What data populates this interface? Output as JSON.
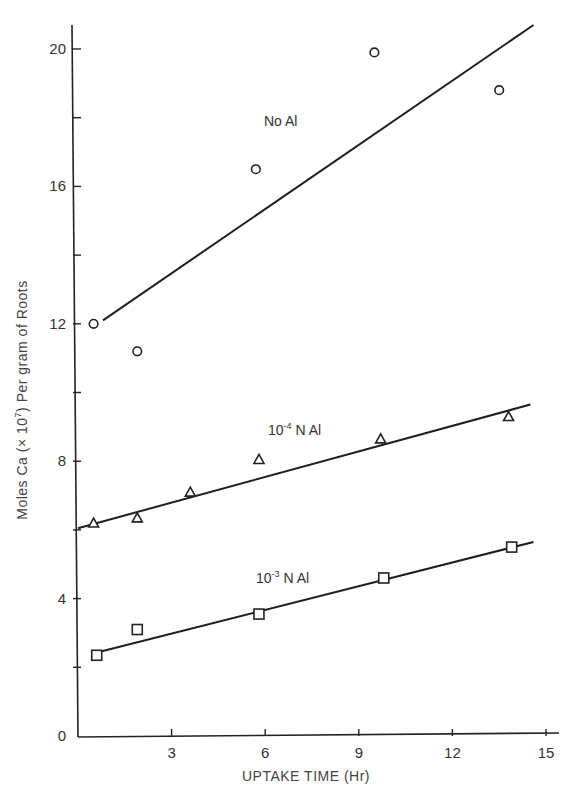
{
  "chart_data": {
    "type": "scatter",
    "title": "",
    "xlabel": "UPTAKE TIME (Hr)",
    "ylabel": "Moles Ca (× 10⁷) Per gram of Roots",
    "ylabel_parts": {
      "prefix": "Moles Ca (",
      "times": "×",
      "base": " 10",
      "exp": "7",
      "suffix": ") Per gram of Roots"
    },
    "xlim": [
      0,
      15
    ],
    "ylim": [
      0,
      20
    ],
    "x_ticks": [
      0,
      3,
      6,
      9,
      12,
      15
    ],
    "x_tick_labels": [
      "3",
      "6",
      "9",
      "12",
      "15"
    ],
    "y_ticks": [
      0,
      2,
      4,
      6,
      8,
      10,
      12,
      14,
      16,
      18,
      20
    ],
    "y_tick_labels": [
      "0",
      "4",
      "8",
      "12",
      "16",
      "20"
    ],
    "grid": false,
    "legend": "inline labels",
    "series": [
      {
        "name": "No Al",
        "label_text": "No Al",
        "marker": "circle",
        "x": [
          0.5,
          1.9,
          5.7,
          9.5,
          13.5
        ],
        "y": [
          12.0,
          11.2,
          16.5,
          19.9,
          18.8
        ],
        "fit_line": {
          "x": [
            0.8,
            14.6
          ],
          "y": [
            12.1,
            20.7
          ]
        }
      },
      {
        "name": "10^-4 N Al",
        "label_base": "10",
        "label_exp": "-4",
        "label_rest": " N Al",
        "marker": "triangle",
        "x": [
          0.5,
          1.9,
          3.6,
          5.8,
          9.7,
          13.8
        ],
        "y": [
          6.2,
          6.35,
          7.1,
          8.05,
          8.65,
          9.3
        ],
        "fit_line": {
          "x": [
            0.0,
            14.5
          ],
          "y": [
            6.05,
            9.65
          ]
        }
      },
      {
        "name": "10^-3 N Al",
        "label_base": "10",
        "label_exp": "-3",
        "label_rest": " N Al",
        "marker": "square",
        "x": [
          0.6,
          1.9,
          5.8,
          9.8,
          13.9
        ],
        "y": [
          2.35,
          3.1,
          3.55,
          4.6,
          5.5
        ],
        "fit_line": {
          "x": [
            0.7,
            14.6
          ],
          "y": [
            2.45,
            5.65
          ]
        }
      }
    ]
  }
}
